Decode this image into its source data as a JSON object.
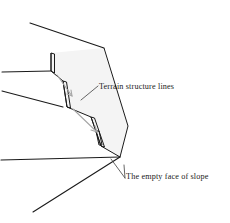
{
  "figure": {
    "type": "technical-line-diagram",
    "background_color": "#ffffff",
    "stroke_color": "#1a1a1a",
    "fill_color": "#f2f2f2",
    "arrow_color": "#9a9a9a",
    "leader_color": "#555555",
    "width": 230,
    "height": 223
  },
  "labels": {
    "terrain_structure_lines": "Terrain structure lines",
    "empty_face_of_slope": "The empty face of slope"
  },
  "geometry": {
    "slope_face_outline": "103,48 128,125 121,156 101,145 91,116 68,107 64,81 51,71 52,53",
    "ridge_top_line": "30,23 103,48",
    "terrain_line_upper": "2,72 51,71",
    "terrain_line_middle": "2,91 64,107",
    "terrain_line_lower_left": "1,160 121,156",
    "terrain_line_bottom": "33,212 121,156",
    "cliff_edge_1": "51,53 51,71",
    "cliff_edge_2": "64,81 64,107",
    "cliff_edge_3": "91,116 91,145",
    "cliff_edge_4": "103,145 103,160",
    "arrow_1": "60,79 72,96",
    "arrow_2": "76,112 97,131",
    "leader_terrain": "82,99 98,86",
    "leader_slope_a": "112,160 126,178",
    "leader_slope_b": "124,166 126,178"
  }
}
